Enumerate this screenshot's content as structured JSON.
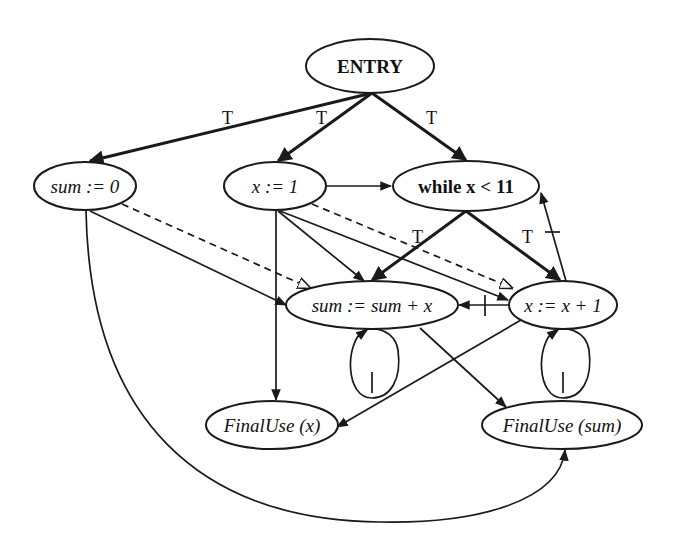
{
  "diagram": {
    "type": "program dependence graph",
    "nodes": {
      "entry": {
        "label": "ENTRY"
      },
      "sum_init": {
        "label": "sum := 0"
      },
      "x_init": {
        "label": "x := 1"
      },
      "while": {
        "label": "while x < 11"
      },
      "sum_update": {
        "label": "sum := sum + x"
      },
      "x_update": {
        "label": "x := x + 1"
      },
      "final_x": {
        "label": "FinalUse (x)"
      },
      "final_sum": {
        "label": "FinalUse (sum)"
      }
    },
    "edge_labels": {
      "entry_sum_init": "T",
      "entry_x_init": "T",
      "entry_while": "T",
      "while_sum_update": "T",
      "while_x_update": "T"
    },
    "edges": [
      {
        "from": "ENTRY",
        "to": "sum := 0",
        "kind": "control",
        "label": "T"
      },
      {
        "from": "ENTRY",
        "to": "x := 1",
        "kind": "control",
        "label": "T"
      },
      {
        "from": "ENTRY",
        "to": "while x < 11",
        "kind": "control",
        "label": "T"
      },
      {
        "from": "while x < 11",
        "to": "sum := sum + x",
        "kind": "control",
        "label": "T"
      },
      {
        "from": "while x < 11",
        "to": "x := x + 1",
        "kind": "control",
        "label": "T"
      },
      {
        "from": "x := 1",
        "to": "while x < 11",
        "kind": "flow"
      },
      {
        "from": "x := 1",
        "to": "sum := sum + x",
        "kind": "flow"
      },
      {
        "from": "x := 1",
        "to": "x := x + 1",
        "kind": "flow"
      },
      {
        "from": "x := 1",
        "to": "FinalUse (x)",
        "kind": "flow"
      },
      {
        "from": "sum := 0",
        "to": "sum := sum + x",
        "kind": "flow"
      },
      {
        "from": "sum := 0",
        "to": "FinalUse (sum)",
        "kind": "flow"
      },
      {
        "from": "sum := 0",
        "to": "sum := sum + x",
        "kind": "def-order (dashed)"
      },
      {
        "from": "x := 1",
        "to": "x := x + 1",
        "kind": "def-order (dashed)"
      },
      {
        "from": "x := x + 1",
        "to": "while x < 11",
        "kind": "loop-carried flow"
      },
      {
        "from": "x := x + 1",
        "to": "sum := sum + x",
        "kind": "loop-carried flow"
      },
      {
        "from": "x := x + 1",
        "to": "FinalUse (x)",
        "kind": "flow"
      },
      {
        "from": "sum := sum + x",
        "to": "FinalUse (sum)",
        "kind": "flow"
      },
      {
        "from": "sum := sum + x",
        "to": "sum := sum + x",
        "kind": "loop-carried self"
      },
      {
        "from": "x := x + 1",
        "to": "x := x + 1",
        "kind": "loop-carried self"
      }
    ]
  }
}
